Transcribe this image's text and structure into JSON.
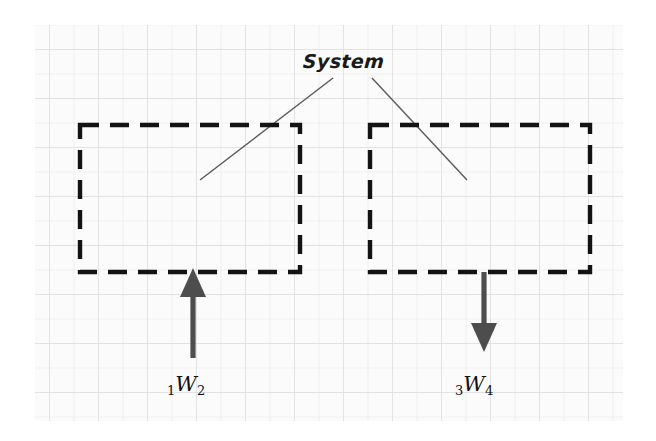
{
  "figure": {
    "title_label": "System",
    "background_color": "#ffffff",
    "paper_color": "#fbfbfb",
    "grid_color": "#e3e3e3",
    "grid_major_color": "#dcdcdc",
    "ink_color": "#1a1a1a",
    "arrow_color": "#4a4a4a",
    "paper": {
      "x": 35,
      "y": 25,
      "width": 588,
      "height": 396,
      "cell": 24.5
    },
    "boundaries": [
      {
        "name": "left-system-boundary",
        "x": 80,
        "y": 125,
        "width": 220,
        "height": 147,
        "style": "dashed"
      },
      {
        "name": "right-system-boundary",
        "x": 370,
        "y": 125,
        "width": 220,
        "height": 147,
        "style": "dashed"
      }
    ],
    "leaders": [
      {
        "name": "left-leader-line",
        "x1": 333,
        "y1": 78,
        "x2": 200,
        "y2": 180
      },
      {
        "name": "right-leader-line",
        "x1": 372,
        "y1": 78,
        "x2": 467,
        "y2": 180
      }
    ],
    "arrows": [
      {
        "name": "work-in-arrow",
        "direction": "up",
        "x": 193,
        "tail_y": 358,
        "tip_y": 270,
        "label": "work-in-label"
      },
      {
        "name": "work-out-arrow",
        "direction": "down",
        "x": 484,
        "tail_y": 272,
        "tip_y": 350,
        "label": "work-out-label"
      }
    ],
    "labels": {
      "work_in": {
        "pre": "1",
        "symbol": "W",
        "post": "2",
        "full": "1W2"
      },
      "work_out": {
        "pre": "3",
        "symbol": "W",
        "post": "4",
        "full": "3W4"
      }
    }
  }
}
